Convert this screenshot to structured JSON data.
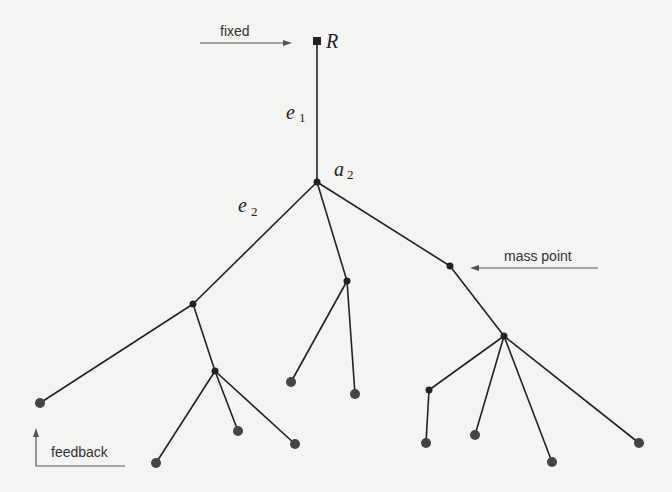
{
  "diagram": {
    "type": "tree",
    "root": {
      "label": "R",
      "x": 317,
      "y": 41
    },
    "labels": {
      "fixed": "fixed",
      "mass_point": "mass point",
      "feedback": "feedback",
      "e1": "e",
      "e1_sub": "1",
      "e2": "e",
      "e2_sub": "2",
      "a2": "a",
      "a2_sub": "2",
      "R": "R"
    },
    "colors": {
      "line": "#222222",
      "node": "#222222",
      "leaf": "#444444",
      "annotation": "#555555",
      "background": "#f4f4f2"
    }
  }
}
